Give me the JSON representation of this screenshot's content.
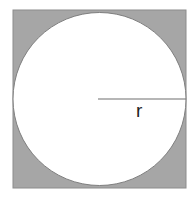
{
  "diagram": {
    "square": {
      "x": 13,
      "y": 10,
      "width": 173,
      "height": 178,
      "fill": "#a6a6a6",
      "stroke": "#8c8c8c"
    },
    "circle": {
      "cx": 99.5,
      "cy": 99,
      "r": 86.5,
      "fill": "#ffffff",
      "stroke": "#7f7f7f"
    },
    "radius_line": {
      "x1": 98,
      "y1": 99,
      "x2": 186,
      "y2": 99,
      "stroke": "#6e6e6e"
    },
    "radius_label": "r"
  }
}
